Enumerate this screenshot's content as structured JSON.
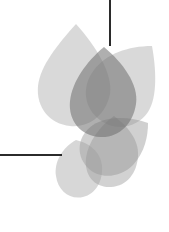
{
  "canvas": {
    "width": 169,
    "height": 232,
    "background_color": "#ffffff",
    "title": "Abstract Flower Mark"
  },
  "artwork": {
    "name": "abstract-flower-graphic",
    "description": "Overlapping translucent gray petal shapes forming a stylized flower, with two thin dark rule lines",
    "petal_fill_color": "#8a8a8a",
    "petal_opacity": "0.42",
    "line_color": "#2b2b2b"
  },
  "petals": [
    {
      "name": "petal-upper-left",
      "tone": "light",
      "fill": "#9b9b9b",
      "opacity": 0.38,
      "path": "M 76 24 C 58 44 40 66 38 86 C 36 108 50 124 70 126 C 90 128 106 114 110 94 C 113 74 96 46 76 24 Z"
    },
    {
      "name": "petal-upper-right",
      "tone": "light",
      "fill": "#9b9b9b",
      "opacity": 0.38,
      "path": "M 152 46 C 128 46 106 54 94 70 C 81 87 84 108 100 120 C 116 132 137 128 148 112 C 158 97 156 68 152 46 Z"
    },
    {
      "name": "petal-center-dark",
      "tone": "dark",
      "fill": "#6e6e6e",
      "opacity": 0.55,
      "path": "M 104 47 C 86 62 72 82 70 101 C 68 121 81 136 100 137 C 119 138 133 124 136 104 C 139 84 122 62 104 47 Z"
    },
    {
      "name": "petal-lower-right",
      "tone": "mid",
      "fill": "#8f8f8f",
      "opacity": 0.42,
      "path": "M 148 123 C 128 116 107 116 93 125 C 78 135 75 154 87 167 C 99 180 120 178 133 165 C 145 152 148 136 148 123 Z"
    },
    {
      "name": "petal-lower-center",
      "tone": "mid",
      "fill": "#8f8f8f",
      "opacity": 0.4,
      "path": "M 114 116 C 100 126 88 142 86 158 C 84 176 95 188 111 187 C 127 186 137 173 138 156 C 139 139 127 126 114 116 Z"
    },
    {
      "name": "petal-lower-left",
      "tone": "light",
      "fill": "#9b9b9b",
      "opacity": 0.4,
      "path": "M 76 140 C 62 148 54 162 56 176 C 58 191 70 200 83 197 C 96 194 103 181 102 166 C 101 152 89 143 76 140 Z"
    }
  ],
  "lines": [
    {
      "name": "vertical-rule",
      "orientation": "vertical",
      "x1": 110,
      "y1": 0,
      "x2": 110,
      "y2": 46,
      "width": 2,
      "color": "#2b2b2b"
    },
    {
      "name": "horizontal-rule",
      "orientation": "horizontal",
      "x1": 0,
      "y1": 155,
      "x2": 62,
      "y2": 155,
      "width": 2,
      "color": "#2b2b2b"
    }
  ]
}
